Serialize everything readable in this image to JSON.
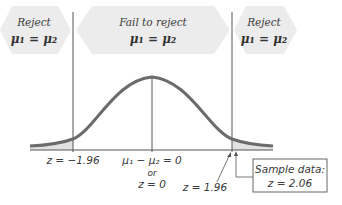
{
  "diagram": {
    "type": "hypothesis-test-normal-curve",
    "regions": [
      {
        "id": "left-reject",
        "title": "Reject",
        "hypothesis": "μ₁ = μ₂"
      },
      {
        "id": "fail-to-reject",
        "title": "Fail to reject",
        "hypothesis": "μ₁ = μ₂"
      },
      {
        "id": "right-reject",
        "title": "Reject",
        "hypothesis": "μ₁ = μ₂"
      }
    ],
    "axis_labels": {
      "left_critical": "z = −1.96",
      "center_line1": "μ₁ − μ₂ = 0",
      "center_or": "or",
      "center_line2": "z = 0",
      "right_critical": "z = 1.96"
    },
    "sample_box": {
      "line1": "Sample data:",
      "line2": "z = 2.06"
    },
    "colors": {
      "band_fill": "#ececec",
      "curve": "#6b6b6b",
      "tail_fill": "#e2e2e2",
      "lines": "#555555",
      "box_border": "#666666"
    }
  }
}
